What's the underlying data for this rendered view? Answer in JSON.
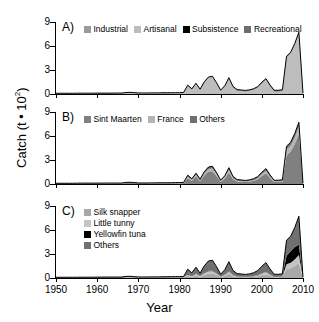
{
  "figure": {
    "ylabel_main": "Catch (t • 10",
    "ylabel_sup": "2",
    "ylabel_close": ")",
    "xlabel": "Year"
  },
  "axes": {
    "yticks": [
      0,
      3,
      6,
      9
    ],
    "ylim": [
      0,
      9
    ],
    "xticks": [
      1950,
      1960,
      1970,
      1980,
      1990,
      2000,
      2010
    ],
    "xlim": [
      1950,
      2010
    ],
    "grid": false
  },
  "colors": {
    "industrial": "#9a9a9a",
    "artisanal": "#bdbdbd",
    "subsistence": "#000000",
    "recreational": "#6e6e6e",
    "sint_maarten": "#808080",
    "france": "#b5b5b5",
    "others_b": "#6e6e6e",
    "silk_snapper": "#a8a8a8",
    "little_tunny": "#c4c4c4",
    "yellowfin_tuna": "#000000",
    "others_c": "#707070",
    "outline": "#000000",
    "axis": "#000000"
  },
  "panels": {
    "a": {
      "label": "A)",
      "legend": [
        {
          "name": "Industrial",
          "color": "#9a9a9a"
        },
        {
          "name": "Artisanal",
          "color": "#bdbdbd"
        },
        {
          "name": "Subsistence",
          "color": "#000000"
        },
        {
          "name": "Recreational",
          "color": "#6e6e6e"
        }
      ]
    },
    "b": {
      "label": "B)",
      "legend": [
        {
          "name": "Sint Maarten",
          "color": "#808080"
        },
        {
          "name": "France",
          "color": "#b5b5b5"
        },
        {
          "name": "Others",
          "color": "#6e6e6e"
        }
      ]
    },
    "c": {
      "label": "C)",
      "legend": [
        {
          "name": "Silk snapper",
          "color": "#a8a8a8"
        },
        {
          "name": "Little tunny",
          "color": "#c4c4c4"
        },
        {
          "name": "Yellowfin tuna",
          "color": "#000000"
        },
        {
          "name": "Others",
          "color": "#707070"
        }
      ]
    }
  },
  "chart_data": {
    "type": "area",
    "title": "",
    "xlabel": "Year",
    "ylabel": "Catch (t • 10^2)",
    "xlim": [
      1950,
      2010
    ],
    "ylim": [
      0,
      9
    ],
    "grid": false,
    "legend_position": "top-inside",
    "x": [
      1950,
      1951,
      1952,
      1953,
      1954,
      1955,
      1956,
      1957,
      1958,
      1959,
      1960,
      1961,
      1962,
      1963,
      1964,
      1965,
      1966,
      1967,
      1968,
      1969,
      1970,
      1971,
      1972,
      1973,
      1974,
      1975,
      1976,
      1977,
      1978,
      1979,
      1980,
      1981,
      1982,
      1983,
      1984,
      1985,
      1986,
      1987,
      1988,
      1989,
      1990,
      1991,
      1992,
      1993,
      1994,
      1995,
      1996,
      1997,
      1998,
      1999,
      2000,
      2001,
      2002,
      2003,
      2004,
      2005,
      2006,
      2007,
      2008,
      2009,
      2010
    ],
    "panels": [
      {
        "id": "A",
        "label": "A)",
        "stacked": true,
        "total_note": "Panel A, B and C all sum to the same total catch series",
        "series": [
          {
            "name": "Industrial",
            "color": "#9a9a9a",
            "values": [
              0,
              0,
              0,
              0,
              0,
              0,
              0,
              0,
              0,
              0,
              0,
              0,
              0,
              0,
              0,
              0,
              0,
              0,
              0,
              0,
              0,
              0,
              0,
              0,
              0,
              0,
              0,
              0,
              0,
              0,
              0,
              0,
              0,
              0,
              0,
              0,
              0,
              0,
              0,
              0,
              0,
              0,
              0,
              0,
              0,
              0,
              0,
              0,
              0,
              0,
              0,
              0,
              0,
              0,
              0,
              0,
              0,
              0,
              0,
              0,
              0
            ]
          },
          {
            "name": "Artisanal",
            "color": "#bdbdbd",
            "values": [
              0.08,
              0.08,
              0.08,
              0.08,
              0.08,
              0.09,
              0.09,
              0.09,
              0.09,
              0.09,
              0.1,
              0.1,
              0.1,
              0.1,
              0.1,
              0.11,
              0.11,
              0.18,
              0.2,
              0.16,
              0.12,
              0.12,
              0.12,
              0.13,
              0.13,
              0.13,
              0.14,
              0.14,
              0.15,
              0.15,
              0.16,
              0.18,
              1.05,
              0.6,
              1.3,
              0.55,
              1.45,
              2.05,
              2.15,
              1.35,
              0.4,
              0.95,
              1.95,
              0.85,
              0.45,
              0.4,
              0.35,
              0.4,
              0.55,
              0.8,
              1.35,
              1.8,
              1.0,
              0.35,
              0.35,
              0.4,
              4.6,
              5.1,
              6.2,
              7.6,
              0.1
            ]
          },
          {
            "name": "Subsistence",
            "color": "#000000",
            "values": [
              0.01,
              0.01,
              0.01,
              0.01,
              0.01,
              0.01,
              0.01,
              0.01,
              0.01,
              0.01,
              0.01,
              0.01,
              0.01,
              0.01,
              0.01,
              0.01,
              0.01,
              0.01,
              0.01,
              0.01,
              0.01,
              0.01,
              0.01,
              0.01,
              0.01,
              0.01,
              0.01,
              0.01,
              0.01,
              0.01,
              0.01,
              0.01,
              0.02,
              0.02,
              0.02,
              0.02,
              0.02,
              0.02,
              0.02,
              0.02,
              0.02,
              0.02,
              0.02,
              0.02,
              0.02,
              0.02,
              0.02,
              0.02,
              0.02,
              0.02,
              0.02,
              0.02,
              0.02,
              0.02,
              0.02,
              0.02,
              0.02,
              0.02,
              0.02,
              0.02,
              0.0
            ]
          },
          {
            "name": "Recreational",
            "color": "#6e6e6e",
            "values": [
              0,
              0,
              0,
              0,
              0,
              0,
              0,
              0,
              0,
              0,
              0,
              0,
              0,
              0,
              0,
              0,
              0,
              0,
              0,
              0,
              0,
              0,
              0,
              0,
              0,
              0,
              0,
              0,
              0,
              0,
              0,
              0,
              0.03,
              0.03,
              0.03,
              0.03,
              0.04,
              0.04,
              0.05,
              0.05,
              0.06,
              0.06,
              0.07,
              0.07,
              0.08,
              0.08,
              0.08,
              0.09,
              0.09,
              0.1,
              0.1,
              0.1,
              0.1,
              0.1,
              0.1,
              0.1,
              0.1,
              0.1,
              0.1,
              0.1,
              0.0
            ]
          }
        ]
      },
      {
        "id": "B",
        "label": "B)",
        "stacked": true,
        "series": [
          {
            "name": "Sint Maarten",
            "color": "#808080",
            "values": [
              0.05,
              0.05,
              0.05,
              0.05,
              0.05,
              0.05,
              0.06,
              0.06,
              0.06,
              0.06,
              0.06,
              0.06,
              0.07,
              0.07,
              0.07,
              0.07,
              0.07,
              0.12,
              0.13,
              0.11,
              0.08,
              0.08,
              0.08,
              0.08,
              0.08,
              0.09,
              0.09,
              0.09,
              0.09,
              0.1,
              0.1,
              0.11,
              0.75,
              0.42,
              0.95,
              0.38,
              1.05,
              1.55,
              1.6,
              1.0,
              0.28,
              0.7,
              1.45,
              0.62,
              0.32,
              0.28,
              0.25,
              0.28,
              0.4,
              0.58,
              1.0,
              1.35,
              0.74,
              0.25,
              0.25,
              0.28,
              3.6,
              4.05,
              5.0,
              6.25,
              0.08
            ]
          },
          {
            "name": "France",
            "color": "#b5b5b5",
            "values": [
              0.02,
              0.02,
              0.02,
              0.02,
              0.02,
              0.02,
              0.02,
              0.02,
              0.02,
              0.02,
              0.02,
              0.02,
              0.02,
              0.02,
              0.02,
              0.02,
              0.02,
              0.04,
              0.04,
              0.03,
              0.02,
              0.02,
              0.02,
              0.03,
              0.03,
              0.03,
              0.03,
              0.03,
              0.03,
              0.03,
              0.04,
              0.04,
              0.2,
              0.12,
              0.22,
              0.1,
              0.25,
              0.32,
              0.34,
              0.22,
              0.08,
              0.16,
              0.32,
              0.14,
              0.09,
              0.08,
              0.07,
              0.08,
              0.1,
              0.14,
              0.24,
              0.3,
              0.18,
              0.08,
              0.08,
              0.09,
              0.7,
              0.75,
              0.85,
              0.95,
              0.01
            ]
          },
          {
            "name": "Others",
            "color": "#6e6e6e",
            "values": [
              0.02,
              0.02,
              0.02,
              0.02,
              0.02,
              0.03,
              0.03,
              0.03,
              0.03,
              0.03,
              0.03,
              0.03,
              0.03,
              0.03,
              0.03,
              0.03,
              0.03,
              0.04,
              0.05,
              0.04,
              0.03,
              0.03,
              0.03,
              0.03,
              0.03,
              0.03,
              0.03,
              0.03,
              0.04,
              0.04,
              0.04,
              0.05,
              0.15,
              0.11,
              0.18,
              0.12,
              0.21,
              0.24,
              0.28,
              0.2,
              0.12,
              0.17,
              0.27,
              0.18,
              0.14,
              0.14,
              0.13,
              0.15,
              0.16,
              0.2,
              0.23,
              0.27,
              0.2,
              0.14,
              0.14,
              0.15,
              0.42,
              0.42,
              0.47,
              0.52,
              0.01
            ]
          }
        ]
      },
      {
        "id": "C",
        "label": "C)",
        "stacked": true,
        "series": [
          {
            "name": "Silk snapper",
            "color": "#a8a8a8",
            "values": [
              0.02,
              0.02,
              0.02,
              0.02,
              0.02,
              0.02,
              0.02,
              0.02,
              0.02,
              0.02,
              0.02,
              0.02,
              0.03,
              0.03,
              0.03,
              0.03,
              0.03,
              0.05,
              0.05,
              0.04,
              0.03,
              0.03,
              0.03,
              0.03,
              0.03,
              0.03,
              0.03,
              0.04,
              0.04,
              0.04,
              0.04,
              0.04,
              0.28,
              0.16,
              0.35,
              0.14,
              0.38,
              0.55,
              0.58,
              0.36,
              0.11,
              0.26,
              0.52,
              0.22,
              0.12,
              0.11,
              0.09,
              0.11,
              0.15,
              0.21,
              0.36,
              0.48,
              0.27,
              0.09,
              0.09,
              0.11,
              1.1,
              1.22,
              1.5,
              1.85,
              0.03
            ]
          },
          {
            "name": "Little tunny",
            "color": "#c4c4c4",
            "values": [
              0.01,
              0.01,
              0.01,
              0.01,
              0.01,
              0.01,
              0.01,
              0.01,
              0.01,
              0.01,
              0.01,
              0.01,
              0.01,
              0.01,
              0.01,
              0.01,
              0.01,
              0.03,
              0.03,
              0.02,
              0.02,
              0.02,
              0.02,
              0.02,
              0.02,
              0.02,
              0.02,
              0.02,
              0.02,
              0.02,
              0.02,
              0.02,
              0.15,
              0.09,
              0.19,
              0.08,
              0.21,
              0.3,
              0.31,
              0.19,
              0.06,
              0.14,
              0.28,
              0.12,
              0.07,
              0.06,
              0.05,
              0.06,
              0.08,
              0.11,
              0.19,
              0.26,
              0.14,
              0.05,
              0.05,
              0.06,
              0.62,
              0.68,
              0.82,
              1.02,
              0.01
            ]
          },
          {
            "name": "Yellowfin tuna",
            "color": "#000000",
            "values": [
              0,
              0,
              0,
              0,
              0,
              0,
              0,
              0,
              0,
              0,
              0,
              0,
              0,
              0,
              0,
              0,
              0,
              0,
              0,
              0,
              0,
              0,
              0,
              0,
              0,
              0,
              0,
              0,
              0,
              0,
              0,
              0,
              0.1,
              0.05,
              0.06,
              0.03,
              0.05,
              0.06,
              0.06,
              0.05,
              0.02,
              0.04,
              0.06,
              0.03,
              0.02,
              0.02,
              0.02,
              0.02,
              0.02,
              0.03,
              0.04,
              0.05,
              0.03,
              0.02,
              0.02,
              0.03,
              1.05,
              1.45,
              1.55,
              1.3,
              0.01
            ]
          },
          {
            "name": "Others",
            "color": "#707070",
            "values": [
              0.06,
              0.06,
              0.06,
              0.06,
              0.06,
              0.07,
              0.07,
              0.07,
              0.07,
              0.07,
              0.08,
              0.08,
              0.08,
              0.08,
              0.08,
              0.08,
              0.08,
              0.12,
              0.13,
              0.11,
              0.08,
              0.08,
              0.08,
              0.09,
              0.09,
              0.09,
              0.1,
              0.1,
              0.1,
              0.11,
              0.11,
              0.13,
              0.57,
              0.35,
              0.75,
              0.35,
              0.87,
              1.2,
              1.27,
              0.82,
              0.29,
              0.59,
              1.18,
              0.57,
              0.34,
              0.31,
              0.29,
              0.32,
              0.41,
              0.57,
              0.88,
              1.13,
              0.68,
              0.31,
              0.31,
              0.32,
              1.95,
              1.87,
              2.45,
              3.55,
              0.05
            ]
          }
        ]
      }
    ]
  }
}
